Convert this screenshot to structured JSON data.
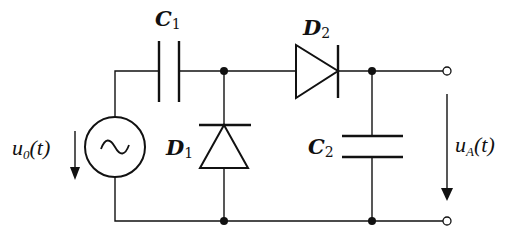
{
  "diagram": {
    "type": "circuit-schematic",
    "components": [
      {
        "id": "source",
        "kind": "ac-voltage-source",
        "label": "u",
        "label_sub": "0",
        "label_arg": "(t)"
      },
      {
        "id": "C1",
        "kind": "capacitor",
        "label": "C",
        "label_sub": "1"
      },
      {
        "id": "D1",
        "kind": "diode",
        "label": "D",
        "label_sub": "1",
        "orientation": "cathode-up"
      },
      {
        "id": "D2",
        "kind": "diode",
        "label": "D",
        "label_sub": "2",
        "orientation": "anode-left"
      },
      {
        "id": "C2",
        "kind": "capacitor",
        "label": "C",
        "label_sub": "2"
      },
      {
        "id": "output",
        "kind": "output-terminals",
        "label": "u",
        "label_sub": "A",
        "label_arg": "(t)"
      }
    ],
    "labels": {
      "c1": {
        "main": "C",
        "sub": "1"
      },
      "d1": {
        "main": "D",
        "sub": "1"
      },
      "d2": {
        "main": "D",
        "sub": "2"
      },
      "c2": {
        "main": "C",
        "sub": "2"
      },
      "u0": {
        "main": "u",
        "sub": "0",
        "arg": "(t)"
      },
      "ua": {
        "main": "u",
        "sub": "A",
        "arg": "(t)"
      }
    },
    "colors": {
      "stroke": "#111111",
      "background": "#ffffff"
    }
  }
}
